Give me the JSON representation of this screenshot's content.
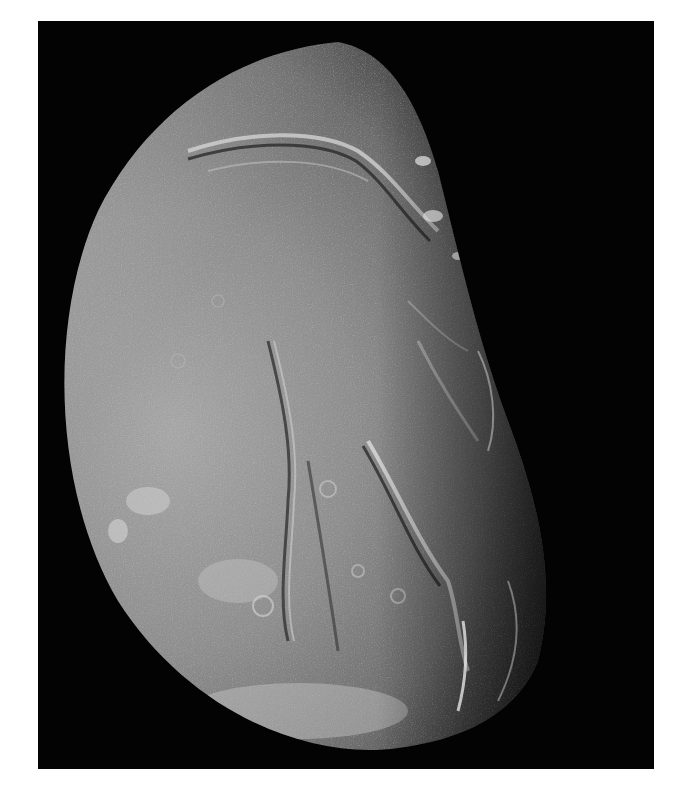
{
  "image": {
    "subject": "moon-photograph",
    "description": "Grayscale spacecraft image of a gibbous icy moon with canyons, ridges and craters; illuminated from the left, terminator on the right",
    "background_color": "#ffffff",
    "frame_color": "#030303",
    "surface_colors": {
      "bright_limb": "#c9c9c9",
      "mid_gray": "#8e8e8e",
      "dark_gray": "#4a4a4a",
      "terminator": "#1a1a1a"
    }
  }
}
